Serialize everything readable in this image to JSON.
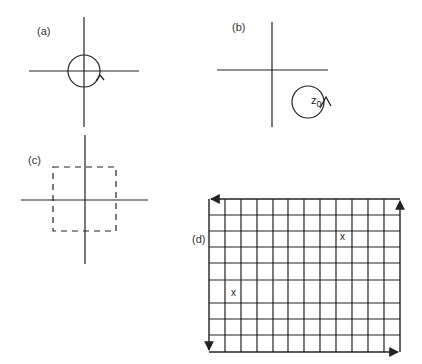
{
  "figure": {
    "panels": [
      {
        "label": "(a)",
        "description": "Complex plane axes with a small circle centered at the origin, counter-clockwise arrow"
      },
      {
        "label": "(b)",
        "description": "Complex plane axes with a circle around a point z0 in the lower-right quadrant, counter-clockwise arrow",
        "point_label": "z",
        "point_subscript": "0"
      },
      {
        "label": "(c)",
        "description": "Complex plane axes with a dashed square centered at the origin"
      },
      {
        "label": "(d)",
        "description": "Rectangular grid lattice with arrows around the boundary and two marked points",
        "grid_columns": 12,
        "grid_rows": 9,
        "marks": [
          "x",
          "x"
        ]
      }
    ]
  },
  "colors": {
    "stroke": "#222222",
    "background": "#ffffff"
  }
}
